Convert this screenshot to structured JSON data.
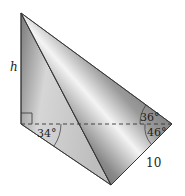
{
  "diagram": {
    "type": "tetrahedron-geometry",
    "labels": {
      "height": "h",
      "angle_left": "34°",
      "angle_top_right": "36°",
      "angle_bottom_right": "46°",
      "side_length": "10"
    },
    "colors": {
      "edge": "#333333",
      "face_light": "#e8e8e8",
      "face_mid": "#a8a8a8",
      "face_dark": "#555555"
    }
  }
}
